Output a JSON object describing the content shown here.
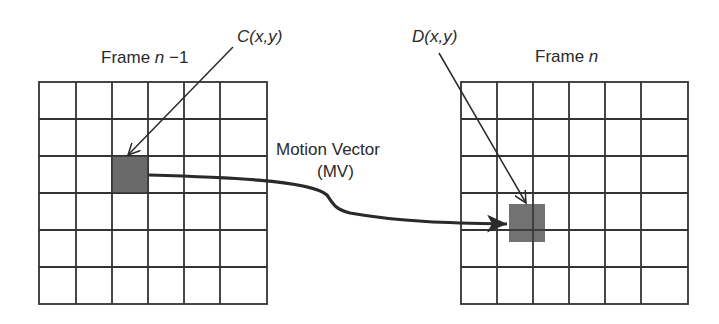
{
  "diagram": {
    "frames": [
      {
        "id": "prev",
        "label_text": "Frame ",
        "label_var": "n",
        "label_suffix": " −1",
        "rows": 6,
        "cols": 6
      },
      {
        "id": "curr",
        "label_text": "Frame ",
        "label_var": "n",
        "label_suffix": "",
        "rows": 6,
        "cols": 6
      }
    ],
    "points": {
      "c": {
        "name": "C",
        "args": "(x,y)"
      },
      "d": {
        "name": "D",
        "args": "(x,y)"
      }
    },
    "motion_vector": {
      "line1": "Motion Vector",
      "line2": "(MV)"
    },
    "colors": {
      "grid": "#333333",
      "block": "#6a6a6a",
      "arrow": "#2a2a2a"
    }
  }
}
